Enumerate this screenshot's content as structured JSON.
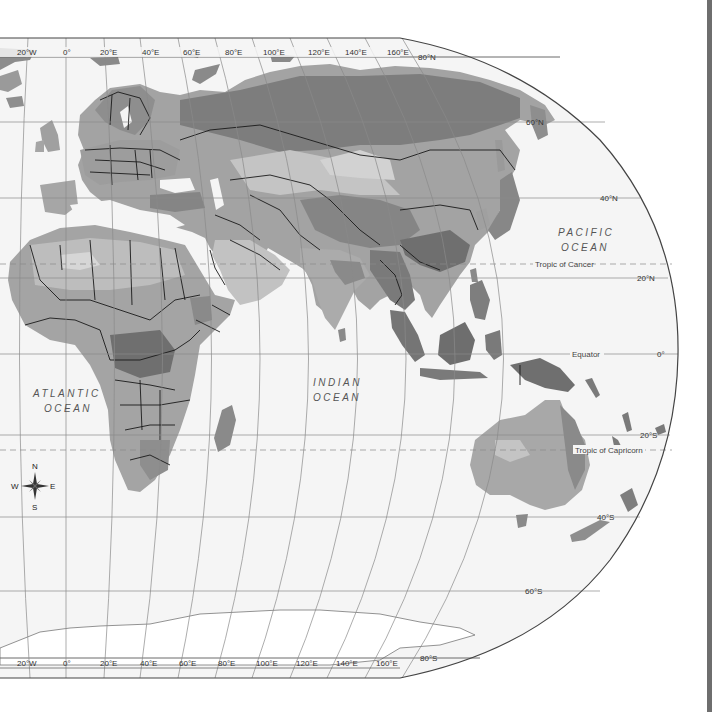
{
  "map": {
    "title": "World physical map (Eastern Hemisphere view)",
    "projection": "Robinson-like, grayscale relief",
    "colors": {
      "ocean": "#f4f4f4",
      "graticule": "#8a8a8a",
      "border": "#1a1a1a",
      "low_land": "#9a9a9a",
      "mid_land": "#b8b8b8",
      "high_land": "#7a7a7a",
      "forest": "#6e6e6e",
      "desert": "#c9c9c9",
      "ice": "#ffffff",
      "frame": "#444444",
      "right_bar": "#6e6e6e"
    },
    "top_longitude_labels": [
      "20°W",
      "0°",
      "20°E",
      "40°E",
      "60°E",
      "80°E",
      "100°E",
      "120°E",
      "140°E",
      "160°E"
    ],
    "bottom_longitude_labels": [
      "20°W",
      "0°",
      "20°E",
      "40°E",
      "60°E",
      "80°E",
      "100°E",
      "120°E",
      "140°E",
      "160°E"
    ],
    "latitude_labels": {
      "n80": "80°N",
      "n60": "60°N",
      "n40": "40°N",
      "n20": "20°N",
      "eq": "0°",
      "s20": "20°S",
      "s40": "40°S",
      "s60": "60°S",
      "s80": "80°S"
    },
    "special_lines": {
      "tropic_cancer": "Tropic of Cancer",
      "equator": "Equator",
      "tropic_capricorn": "Tropic of Capricorn"
    },
    "oceans": {
      "pacific_1": "PACIFIC",
      "pacific_2": "OCEAN",
      "atlantic_1": "ATLANTIC",
      "atlantic_2": "OCEAN",
      "indian_1": "INDIAN",
      "indian_2": "OCEAN"
    },
    "compass": {
      "n": "N",
      "s": "S",
      "e": "E",
      "w": "W"
    }
  }
}
